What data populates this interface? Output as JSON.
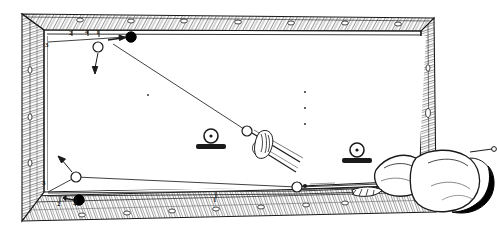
{
  "illustration": {
    "title": "Billiard table bank-shot diagram",
    "subject": "pool-table-top-view-with-player",
    "view": "overhead",
    "style": "black-and-white line engraving",
    "ink_color": "#1a1a1a",
    "paper_color": "#ffffff"
  },
  "table": {
    "name": "billiard-table",
    "rail_wood": "hatched timber rails",
    "bed_color": "#ffffff",
    "outer": {
      "x": 18,
      "y": 10,
      "w": 418,
      "h": 212
    },
    "bed": {
      "x": 44,
      "y": 30,
      "w": 364,
      "h": 162
    },
    "rail_diamonds": {
      "top_count": 7,
      "bottom_count": 7,
      "left_count": 3,
      "right_count": 3,
      "glyph": "o"
    }
  },
  "balls": [
    {
      "id": "cue-ball-top",
      "kind": "cue",
      "fill": "white",
      "cx": 98,
      "cy": 47,
      "r": 5
    },
    {
      "id": "object-ball-top",
      "kind": "object",
      "fill": "black",
      "cx": 131,
      "cy": 37,
      "r": 5
    },
    {
      "id": "cue-ball-lower",
      "kind": "cue",
      "fill": "white",
      "cx": 76,
      "cy": 177,
      "r": 5
    },
    {
      "id": "object-ball-lower",
      "kind": "object",
      "fill": "black",
      "cx": 79,
      "cy": 200,
      "r": 5
    },
    {
      "id": "ball-at-cue-tip",
      "kind": "cue",
      "fill": "white",
      "cx": 247,
      "cy": 131,
      "r": 5
    },
    {
      "id": "ball-on-rail-low",
      "kind": "cue",
      "fill": "white",
      "cx": 297,
      "cy": 187,
      "r": 5
    }
  ],
  "spot_markers": [
    {
      "id": "spot-marker-left",
      "cx": 211,
      "cy": 138,
      "note": "ball resting on a marker block"
    },
    {
      "id": "spot-marker-right",
      "cx": 357,
      "cy": 152,
      "note": "ball resting on a marker block"
    }
  ],
  "table_spots": [
    {
      "cx": 305,
      "cy": 92
    },
    {
      "cx": 305,
      "cy": 108
    },
    {
      "cx": 305,
      "cy": 124
    },
    {
      "cx": 148,
      "cy": 95
    }
  ],
  "position_labels": [
    {
      "text": "3",
      "x": 45,
      "y": 46,
      "name": "position-label-3-upper-left"
    },
    {
      "text": "2",
      "x": 71,
      "y": 35,
      "name": "position-label-2-top"
    },
    {
      "text": "4",
      "x": 86,
      "y": 34,
      "name": "position-label-4-top"
    },
    {
      "text": "1",
      "x": 97,
      "y": 34,
      "name": "position-label-1-top"
    },
    {
      "text": "3",
      "x": 44,
      "y": 184,
      "name": "position-label-3-lower-left"
    },
    {
      "text": "2",
      "x": 59,
      "y": 205,
      "name": "position-label-2-bottom"
    },
    {
      "text": "4",
      "x": 74,
      "y": 205,
      "name": "position-label-4-bottom"
    },
    {
      "text": "1",
      "x": 214,
      "y": 202,
      "name": "position-label-1-bottom"
    }
  ],
  "shot_lines": {
    "name": "aiming-and-path-lines",
    "paths": [
      {
        "id": "long-diagonal-path",
        "d": "M 113 44 L 247 131"
      },
      {
        "id": "top-rail-contact",
        "d": "M 48 42 L 126 37"
      },
      {
        "id": "lower-bank-left",
        "d": "M 48 192 L 76 177"
      },
      {
        "id": "lower-bank-right",
        "d": "M 76 177 L 297 187"
      },
      {
        "id": "lower-long-return",
        "d": "M 297 187 L 436 182"
      },
      {
        "id": "bottom-rail-return",
        "d": "M 48 193 L 300 191 L 430 186"
      }
    ]
  },
  "direction_arrows": [
    {
      "id": "arrow-cue-ball-top-down",
      "from": [
        98,
        54
      ],
      "to": [
        95,
        72
      ]
    },
    {
      "id": "arrow-object-ball-top",
      "from": [
        110,
        40
      ],
      "to": [
        124,
        37
      ]
    },
    {
      "id": "arrow-lower-cue-up-left",
      "from": [
        72,
        172
      ],
      "to": [
        61,
        159
      ]
    },
    {
      "id": "arrow-lower-object-right",
      "from": [
        64,
        198
      ],
      "to": [
        74,
        200
      ]
    }
  ],
  "cues": [
    {
      "id": "cue-stick-upper",
      "note": "cue held by bridge hand aiming at ball"
    },
    {
      "id": "cue-stick-lower",
      "note": "cue in player's grip along bottom rail"
    }
  ],
  "player": {
    "name": "player-figure",
    "description": "player leaning over the foot of the table, head and shoulders with dark hair",
    "hair_fill": "#000000",
    "bridge_hand": "bridge-hand-on-table"
  }
}
